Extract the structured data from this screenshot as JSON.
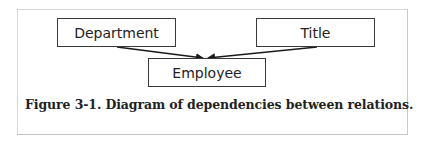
{
  "diagram": {
    "nodes": [
      {
        "id": "department",
        "label": "Department"
      },
      {
        "id": "title",
        "label": "Title"
      },
      {
        "id": "employee",
        "label": "Employee"
      }
    ],
    "edges": [
      {
        "from": "department",
        "to": "employee"
      },
      {
        "from": "title",
        "to": "employee"
      }
    ],
    "caption": "Figure 3-1. Diagram of dependencies between relations."
  }
}
